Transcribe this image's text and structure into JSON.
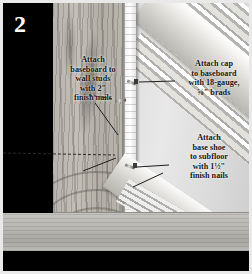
{
  "figure": {
    "step_badge": "2",
    "domain_note": "grayscale instructional photo of baseboard, cap molding and base shoe trim installation at a wall-floor corner"
  },
  "callouts": [
    {
      "id": "callout-baseboard",
      "name": "callout-attach-baseboard",
      "lines": [
        "Attach",
        "baseboard to",
        "wall studs",
        "with 2\"",
        "finish nails"
      ],
      "target": "baseboard-nail"
    },
    {
      "id": "callout-cap",
      "name": "callout-attach-cap",
      "lines": [
        "Attach cap",
        "to baseboard",
        "with 18-gauge,",
        "⅝\" brads"
      ],
      "target": "cap-nail"
    },
    {
      "id": "callout-shoe",
      "name": "callout-attach-base-shoe",
      "lines": [
        "Attach",
        "base shoe",
        "to subfloor",
        "with 1½\"",
        "finish nails"
      ],
      "target": "shoe-nail"
    }
  ],
  "parts": {
    "wall_label": "wall / drywall surface",
    "baseboard_label": "baseboard with vertical wood grain",
    "cap_molding_label": "cap molding, diagonal upper right",
    "base_shoe_label": "base shoe, diagonal lower right",
    "subfloor_label": "subfloor band"
  },
  "colors": {
    "frame": "#e9e9e9",
    "mask": "#000000",
    "badge_text": "#ffffff",
    "callout_text": "#141414",
    "wall": "#e0e0e0",
    "baseboard": "#bab6ae",
    "subfloor": "#b8b6b1",
    "leader_line": "#2a2a2a"
  }
}
